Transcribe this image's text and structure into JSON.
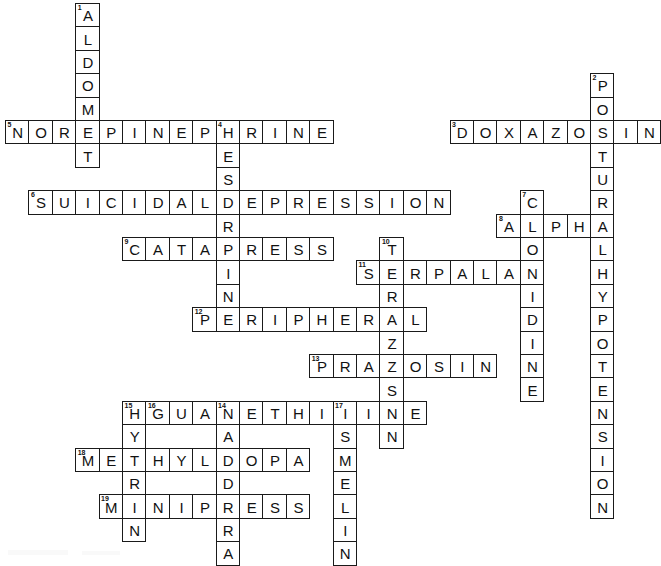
{
  "puzzle": {
    "title": "Antihypertensive Drugs Crossword",
    "cell_size": 23.4,
    "origin_x": 5,
    "origin_y": 3,
    "cols": 28,
    "rows": 24,
    "cell_border_color": "#1a1a1a",
    "cell_fill_color": "#ffffff",
    "letter_color": "#111111",
    "page_background": "#ffffff",
    "entries": [
      {
        "number": "1",
        "direction": "down",
        "answer": "ALDOMET",
        "row": 0,
        "col": 3
      },
      {
        "number": "2",
        "direction": "down",
        "answer": "POSTURALHYPOTENSION",
        "row": 3,
        "col": 25
      },
      {
        "number": "3",
        "direction": "across",
        "answer": "DOXAZOSIN",
        "row": 5,
        "col": 19
      },
      {
        "number": "4",
        "direction": "down",
        "answer": "RESERPINE",
        "row": 5,
        "col": 9
      },
      {
        "number": "5",
        "direction": "across",
        "answer": "NOREPINEPHRINE",
        "row": 5,
        "col": 0
      },
      {
        "number": "6",
        "direction": "across",
        "answer": "SUICIDALDEPRESSION",
        "row": 8,
        "col": 1
      },
      {
        "number": "7",
        "direction": "down",
        "answer": "CLONIDINE",
        "row": 8,
        "col": 22
      },
      {
        "number": "8",
        "direction": "across",
        "answer": "ALPHA",
        "row": 9,
        "col": 21
      },
      {
        "number": "9",
        "direction": "across",
        "answer": "CATAPRESS",
        "row": 10,
        "col": 5
      },
      {
        "number": "10",
        "direction": "down",
        "answer": "TERAZOSIN",
        "row": 10,
        "col": 16
      },
      {
        "number": "11",
        "direction": "across",
        "answer": "SERPALAN",
        "row": 11,
        "col": 15
      },
      {
        "number": "12",
        "direction": "across",
        "answer": "PERIPHERAL",
        "row": 13,
        "col": 8
      },
      {
        "number": "13",
        "direction": "across",
        "answer": "PRAZOSIN",
        "row": 15,
        "col": 13
      },
      {
        "number": "14",
        "direction": "down",
        "answer": "CARDURA",
        "row": 17,
        "col": 9
      },
      {
        "number": "15",
        "direction": "down",
        "answer": "HYTRIN",
        "row": 17,
        "col": 5
      },
      {
        "number": "16",
        "direction": "across",
        "answer": "GUANETHIDINE",
        "row": 17,
        "col": 6
      },
      {
        "number": "17",
        "direction": "down",
        "answer": "ISMELIN",
        "row": 17,
        "col": 14
      },
      {
        "number": "18",
        "direction": "across",
        "answer": "METHYLDOPA",
        "row": 19,
        "col": 3
      },
      {
        "number": "19",
        "direction": "across",
        "answer": "MINIPRESS",
        "row": 21,
        "col": 4
      }
    ]
  }
}
